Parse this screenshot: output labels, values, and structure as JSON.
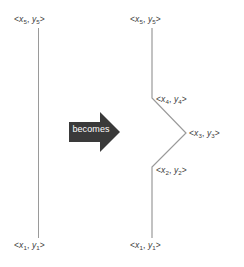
{
  "figure": {
    "type": "diagram",
    "colors": {
      "line": "#9a9a9a",
      "label_text": "#3d3d3d",
      "arrow_fill": "#3a3a3a",
      "arrow_text": "#ffffff",
      "background": "#ffffff"
    },
    "left_panel": {
      "name": "original-segment",
      "labels": [
        {
          "id": "left-top",
          "point": "5",
          "text_prefix": "<",
          "x_var": "x",
          "y_var": "y",
          "subscript": "5",
          "text": "<x5, y5>"
        },
        {
          "id": "left-bottom",
          "point": "1",
          "text_prefix": "<",
          "x_var": "x",
          "y_var": "y",
          "subscript": "1",
          "text": "<x1, y1>"
        }
      ],
      "segment": {
        "x": 38.5,
        "y_top": 28,
        "y_bottom": 238
      }
    },
    "arrow": {
      "name": "becomes-arrow",
      "label": "becomes"
    },
    "right_panel": {
      "name": "subdivided-polyline",
      "labels": [
        {
          "id": "right-top",
          "subscript": "5",
          "text": "<x5, y5>"
        },
        {
          "id": "right-x4",
          "subscript": "4",
          "text": "<x4, y4>"
        },
        {
          "id": "right-x3",
          "subscript": "3",
          "text": "<x3, y3>"
        },
        {
          "id": "right-x2",
          "subscript": "2",
          "text": "<x2, y2>"
        },
        {
          "id": "right-bottom",
          "subscript": "1",
          "text": "<x1, y1>"
        }
      ],
      "vertices": [
        {
          "label": "x5",
          "x": 152,
          "y": 28
        },
        {
          "label": "x4",
          "x": 152,
          "y": 98
        },
        {
          "label": "x3",
          "x": 186,
          "y": 133
        },
        {
          "label": "x2",
          "x": 152,
          "y": 167
        },
        {
          "label": "x1",
          "x": 152,
          "y": 238
        }
      ]
    },
    "glyphs": {
      "open_angle": "<",
      "close_angle": ">",
      "comma": ",",
      "x_var": "x",
      "y_var": "y",
      "sub1": "1",
      "sub2": "2",
      "sub3": "3",
      "sub4": "4",
      "sub5": "5"
    }
  }
}
